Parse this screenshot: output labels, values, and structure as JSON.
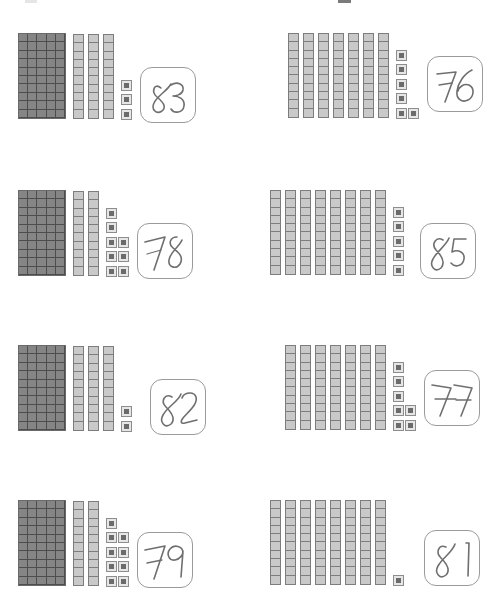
{
  "page": {
    "background_color": "#ffffff",
    "width": 479,
    "height": 589
  },
  "legend": {
    "flat_label": "fifty-flat (5 x 10 = 50)",
    "rod_label": "ten-rod (10)",
    "unit_label": "unit cube (1)",
    "flat_color": "#858585",
    "rod_color": "#c9c9c9",
    "unit_color": "#6b6b6b",
    "ink_color": "#6f6f6f",
    "box_border_color": "#9a9a9a"
  },
  "problems": [
    {
      "id": "p1",
      "position": "row1-left",
      "flats": 1,
      "rods": 3,
      "units": 3,
      "unit_columns": [
        3
      ],
      "total": 83,
      "answer": "83",
      "answer_handwritten": true
    },
    {
      "id": "p2",
      "position": "row1-right",
      "flats": 0,
      "rods": 7,
      "units": 6,
      "unit_columns": [
        5,
        1
      ],
      "total": 76,
      "answer": "76",
      "answer_handwritten": true
    },
    {
      "id": "p3",
      "position": "row2-left",
      "flats": 1,
      "rods": 2,
      "units": 8,
      "unit_columns": [
        5,
        3
      ],
      "total": 78,
      "answer": "78",
      "answer_handwritten": true
    },
    {
      "id": "p4",
      "position": "row2-right",
      "flats": 0,
      "rods": 8,
      "units": 5,
      "unit_columns": [
        5
      ],
      "total": 85,
      "answer": "85",
      "answer_handwritten": true
    },
    {
      "id": "p5",
      "position": "row3-left",
      "flats": 1,
      "rods": 3,
      "units": 2,
      "unit_columns": [
        2
      ],
      "total": 82,
      "answer": "82",
      "answer_handwritten": true
    },
    {
      "id": "p6",
      "position": "row3-right",
      "flats": 0,
      "rods": 7,
      "units": 7,
      "unit_columns": [
        5,
        2
      ],
      "total": 77,
      "answer": "77",
      "answer_handwritten": true
    },
    {
      "id": "p7",
      "position": "row4-left",
      "flats": 1,
      "rods": 2,
      "units": 9,
      "unit_columns": [
        5,
        4
      ],
      "total": 79,
      "answer": "79",
      "answer_handwritten": true
    },
    {
      "id": "p8",
      "position": "row4-right",
      "flats": 0,
      "rods": 8,
      "units": 1,
      "unit_columns": [
        1
      ],
      "total": 81,
      "answer": "81",
      "answer_handwritten": true
    }
  ]
}
